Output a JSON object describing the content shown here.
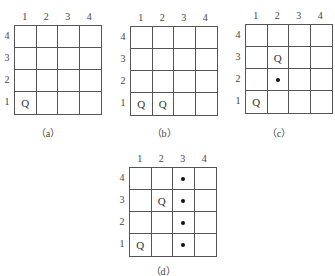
{
  "boards": [
    {
      "id": "a",
      "caption": "（a）",
      "col_labels": [
        "1",
        "2",
        "3",
        "4"
      ],
      "row_labels": [
        "4",
        "3",
        "2",
        "1"
      ],
      "cells": [
        [
          "",
          "",
          "",
          ""
        ],
        [
          "",
          "",
          "",
          ""
        ],
        [
          "",
          "",
          "",
          ""
        ],
        [
          "Q",
          "",
          "",
          ""
        ]
      ]
    },
    {
      "id": "b",
      "caption": "（b）",
      "col_labels": [
        "1",
        "2",
        "3",
        "4"
      ],
      "row_labels": [
        "4",
        "3",
        "2",
        "1"
      ],
      "cells": [
        [
          "",
          "",
          "",
          ""
        ],
        [
          "",
          "",
          "",
          ""
        ],
        [
          "",
          "",
          "",
          ""
        ],
        [
          "Q",
          "Q",
          "",
          ""
        ]
      ]
    },
    {
      "id": "c",
      "caption": "（c）",
      "col_labels": [
        "1",
        "2",
        "3",
        "4"
      ],
      "row_labels": [
        "4",
        "3",
        "2",
        "1"
      ],
      "cells": [
        [
          "",
          "",
          "",
          ""
        ],
        [
          "",
          "Q",
          "",
          ""
        ],
        [
          "",
          "•",
          "",
          ""
        ],
        [
          "Q",
          "",
          "",
          ""
        ]
      ]
    },
    {
      "id": "d",
      "caption": "（d）",
      "col_labels": [
        "1",
        "2",
        "3",
        "4"
      ],
      "row_labels": [
        "4",
        "3",
        "2",
        "1"
      ],
      "cells": [
        [
          "",
          "",
          "•",
          ""
        ],
        [
          "",
          "Q",
          "•",
          ""
        ],
        [
          "",
          "",
          "•",
          ""
        ],
        [
          "Q",
          "",
          "•",
          ""
        ]
      ]
    }
  ]
}
